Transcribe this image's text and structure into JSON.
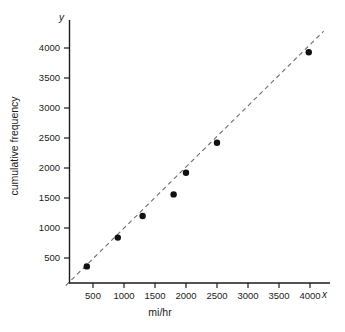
{
  "chart_data": {
    "type": "scatter",
    "title": "",
    "xlabel": "mi/hr",
    "ylabel": "cumulative frequency",
    "x_axis_name": "x",
    "y_axis_name": "y",
    "xticks": [
      "500",
      "1000",
      "1500",
      "2000",
      "2500",
      "3000",
      "3500",
      "4000"
    ],
    "xtick_values": [
      500,
      1000,
      1500,
      2000,
      2500,
      3000,
      3500,
      4000
    ],
    "yticks": [
      "500",
      "1000",
      "1500",
      "2000",
      "2500",
      "3000",
      "3500",
      "4000"
    ],
    "ytick_values": [
      500,
      1000,
      1500,
      2000,
      2500,
      3000,
      3500,
      4000
    ],
    "ylim": [
      0,
      4300
    ],
    "grid": false,
    "legend": null,
    "x": [
      400,
      900,
      1300,
      1800,
      2000,
      2500,
      3980
    ],
    "y": [
      360,
      840,
      1200,
      1560,
      1920,
      2420,
      3930
    ],
    "points": [
      {
        "x": 400,
        "y": 360
      },
      {
        "x": 900,
        "y": 840
      },
      {
        "x": 1300,
        "y": 1200
      },
      {
        "x": 1800,
        "y": 1560
      },
      {
        "x": 2000,
        "y": 1920
      },
      {
        "x": 2500,
        "y": 2420
      },
      {
        "x": 3980,
        "y": 3930
      }
    ],
    "marker_color": "#111111",
    "fit_line": {
      "style": "dashed",
      "color": "#6e6e6e",
      "from": {
        "x": 60,
        "y": 40
      },
      "to": {
        "x": 4220,
        "y": 4280
      }
    },
    "axis_color": "#1b1b1b"
  }
}
